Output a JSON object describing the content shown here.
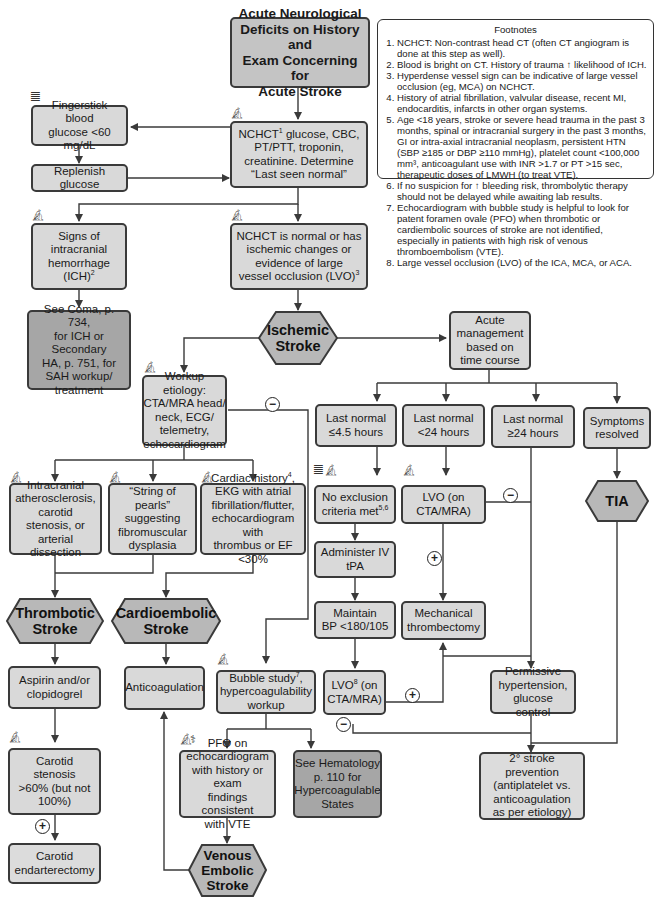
{
  "footnotes": {
    "title": "Footnotes",
    "items": [
      "NCHCT: Non-contrast head CT (often CT angiogram is done at this step as well).",
      "Blood is bright on CT. History of trauma ↑ likelihood of ICH.",
      "Hyperdense vessel sign can be indicative of large vessel occlusion (eg, MCA) on NCHCT.",
      "History of atrial fibrillation, valvular disease, recent MI, endocarditis, infarcts in other organ systems.",
      "Age <18 years, stroke or severe head trauma in the past 3 months, spinal or intracranial surgery in the past 3 months, GI or intra-axial intracranial neoplasm, persistent HTN (SBP ≥185 or DBP ≥110 mmHg), platelet count <100,000 mm³, anticoagulant use with INR >1.7 or PT >15 sec, therapeutic doses of LMWH (to treat VTE).",
      "If no suspicion for ↑ bleeding risk, thrombolytic therapy should not be delayed while awaiting lab results.",
      "Echocardiogram with bubble study is helpful to look for patent foramen ovale (PFO) when thrombotic or cardiembolic sources of stroke are not identified, especially in patients with high risk of venous thromboembolism (VTE).",
      "Large vessel occlusion (LVO) of the ICA, MCA, or ACA."
    ]
  },
  "nodes": {
    "start": [
      "Acute Neurological",
      "Deficits on History and",
      "Exam Concerning for",
      "Acute Stroke"
    ],
    "fingerstick": [
      "Fingerstick blood",
      "glucose <60 mg/dL"
    ],
    "replenish": [
      "Replenish glucose"
    ],
    "nchct_labs": {
      "lines": [
        "glucose, CBC,",
        "PT/PTT, troponin,",
        "creatinine. Determine",
        "“Last seen normal”"
      ],
      "lead": "NCHCT",
      "sup": "1"
    },
    "ich_signs": {
      "lines": [
        "Signs of",
        "intracranial",
        "hemorrhage"
      ],
      "last": "(ICH)",
      "sup": "2"
    },
    "nchct_normal": {
      "lines": [
        "NCHCT is normal or has",
        "ischemic changes or",
        "evidence of large"
      ],
      "last": "vessel occlusion (LVO)",
      "sup": "3"
    },
    "see_coma": [
      "See Coma, p. 734,",
      "for ICH or Secondary",
      "HA, p. 751, for",
      "SAH workup/",
      "treatment"
    ],
    "ischemic_stroke": [
      "Ischemic",
      "Stroke"
    ],
    "acute_mgmt": [
      "Acute",
      "management",
      "based on",
      "time course"
    ],
    "workup": [
      "Workup etiology:",
      "CTA/MRA head/",
      "neck, ECG/",
      "telemetry,",
      "echocardiogram"
    ],
    "last_45": [
      "Last normal",
      "≤4.5 hours"
    ],
    "last_lt24": [
      "Last normal",
      "<24 hours"
    ],
    "last_ge24": [
      "Last normal",
      "≥24 hours"
    ],
    "symptoms_resolved": [
      "Symptoms",
      "resolved"
    ],
    "intracranial": [
      "Intracranial",
      "atherosclerosis,",
      "carotid stenosis, or",
      "arterial dissection"
    ],
    "string_pearls": [
      "“String of pearls”",
      "suggesting",
      "fibromuscular",
      "dysplasia"
    ],
    "cardiac": {
      "first": "Cardiac history",
      "sup": "4",
      "rest": [
        ",",
        "EKG with atrial",
        "fibrillation/flutter,",
        "echocardiogram with",
        "thrombus or EF <30%"
      ]
    },
    "no_exclusion": {
      "first": "No exclusion",
      "last": "criteria met",
      "sup": "5,6"
    },
    "lvo_cta": [
      "LVO (on",
      "CTA/MRA)"
    ],
    "tia": [
      "TIA"
    ],
    "administer_tpa": [
      "Administer IV",
      "tPA"
    ],
    "maintain_bp": [
      "Maintain",
      "BP <180/105"
    ],
    "mech_thrombectomy": [
      "Mechanical",
      "thrombectomy"
    ],
    "thrombotic_stroke": [
      "Thrombotic",
      "Stroke"
    ],
    "cardioembolic_stroke": [
      "Cardioembolic",
      "Stroke"
    ],
    "lvo8": {
      "first": "LVO",
      "sup": "8",
      "after": " (on",
      "last": "CTA/MRA)"
    },
    "permissive": [
      "Permissive",
      "hypertension,",
      "glucose control"
    ],
    "aspirin": [
      "Aspirin and/or",
      "clopidogrel"
    ],
    "anticoagulation": [
      "Anticoagulation"
    ],
    "bubble": {
      "first": "Bubble study",
      "sup": "7",
      "after": ",",
      "rest": [
        "hypercoagulability",
        "workup"
      ]
    },
    "secondary_prevention": [
      "2° stroke prevention",
      "(antiplatelet vs.",
      "anticoagulation",
      "as per etiology)"
    ],
    "carotid_stenosis": [
      "Carotid stenosis",
      ">60% (but not",
      "100%)"
    ],
    "pfo": [
      "PFO on",
      "echocardiogram",
      "with history or exam",
      "findings consistent",
      "with VTE"
    ],
    "see_hematology": [
      "See Hematology",
      "p. 110 for",
      "Hypercoagulable",
      "States"
    ],
    "carotid_endarterectomy": [
      "Carotid",
      "endarterectomy"
    ],
    "venous_embolic": [
      "Venous",
      "Embolic",
      "Stroke"
    ]
  },
  "signs": {
    "plus": "+",
    "minus": "−"
  },
  "icons": {
    "microscope": "microscope-icon",
    "test_tube": "test-tube-icon",
    "stethoscope": "stethoscope-icon"
  },
  "colors": {
    "box_fill": "#d9d9d9",
    "title_fill": "#c4c4c4",
    "reference_fill": "#a6a6a6",
    "hex_fill": "#b8b8b8",
    "line": "#3a3a3a"
  }
}
